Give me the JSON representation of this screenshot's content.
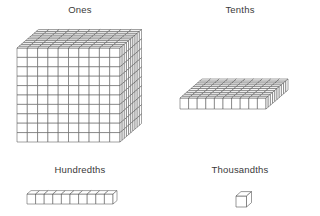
{
  "diagram": {
    "background_color": "#ffffff",
    "line_color": "#555555",
    "face_color": "#ffffff",
    "label_color": "#3a3a3a"
  },
  "blocks": [
    {
      "id": "ones",
      "label": "Ones",
      "shape": "cube",
      "units_wide": 10,
      "units_high": 10,
      "units_deep": 10,
      "unit_count": 1000,
      "value": "1",
      "icon": "ones-cube-icon"
    },
    {
      "id": "tenths",
      "label": "Tenths",
      "shape": "flat-slab",
      "units_wide": 10,
      "units_high": 1,
      "units_deep": 10,
      "unit_count": 100,
      "value": "0.1",
      "icon": "tenths-flat-icon"
    },
    {
      "id": "hundredths",
      "label": "Hundredths",
      "shape": "rod",
      "units_wide": 10,
      "units_high": 1,
      "units_deep": 1,
      "unit_count": 10,
      "value": "0.01",
      "icon": "hundredths-rod-icon"
    },
    {
      "id": "thousandths",
      "label": "Thousandths",
      "shape": "unit-cube",
      "units_wide": 1,
      "units_high": 1,
      "units_deep": 1,
      "unit_count": 1,
      "value": "0.001",
      "icon": "thousandths-unit-icon"
    }
  ]
}
